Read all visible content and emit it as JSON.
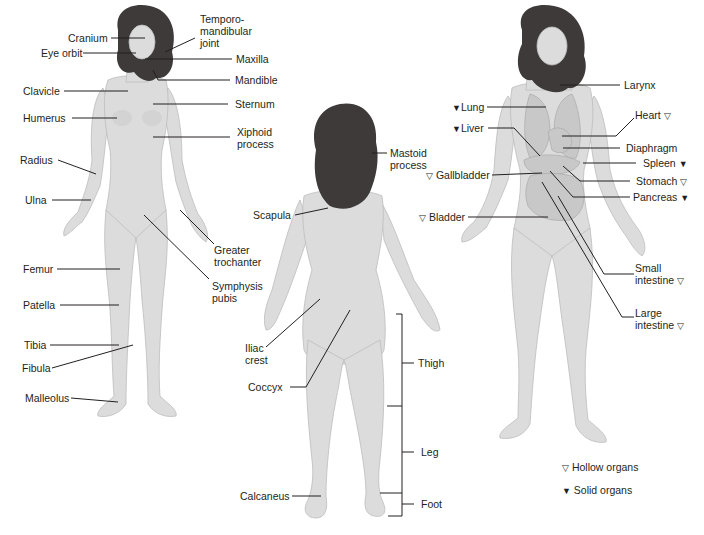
{
  "figures": {
    "anterior_skeletal": {
      "labels": [
        {
          "id": "cranium",
          "text": "Cranium"
        },
        {
          "id": "eye_orbit",
          "text": "Eye orbit"
        },
        {
          "id": "temporomandibular_joint",
          "text": "Temporo-\nmandibular\njoint"
        },
        {
          "id": "maxilla",
          "text": "Maxilla"
        },
        {
          "id": "mandible",
          "text": "Mandible"
        },
        {
          "id": "clavicle",
          "text": "Clavicle"
        },
        {
          "id": "sternum",
          "text": "Sternum"
        },
        {
          "id": "humerus",
          "text": "Humerus"
        },
        {
          "id": "xiphoid_process",
          "text": "Xiphoid\nprocess"
        },
        {
          "id": "radius",
          "text": "Radius"
        },
        {
          "id": "ulna",
          "text": "Ulna"
        },
        {
          "id": "greater_trochanter",
          "text": "Greater\ntrochanter"
        },
        {
          "id": "femur",
          "text": "Femur"
        },
        {
          "id": "symphysis_pubis",
          "text": "Symphysis\npubis"
        },
        {
          "id": "patella",
          "text": "Patella"
        },
        {
          "id": "tibia",
          "text": "Tibia"
        },
        {
          "id": "fibula",
          "text": "Fibula"
        },
        {
          "id": "malleolus",
          "text": "Malleolus"
        }
      ]
    },
    "posterior": {
      "labels": [
        {
          "id": "mastoid_process",
          "text": "Mastoid\nprocess"
        },
        {
          "id": "scapula",
          "text": "Scapula"
        },
        {
          "id": "iliac_crest",
          "text": "Iliac\ncrest"
        },
        {
          "id": "coccyx",
          "text": "Coccyx"
        },
        {
          "id": "calcaneus",
          "text": "Calcaneus"
        }
      ],
      "regions": [
        {
          "id": "thigh",
          "text": "Thigh"
        },
        {
          "id": "leg",
          "text": "Leg"
        },
        {
          "id": "foot",
          "text": "Foot"
        }
      ]
    },
    "anterior_organs": {
      "labels": [
        {
          "id": "larynx",
          "text": "Larynx",
          "symbol": ""
        },
        {
          "id": "lung",
          "text": "Lung",
          "symbol": "▼"
        },
        {
          "id": "heart",
          "text": "Heart",
          "symbol": "▽"
        },
        {
          "id": "liver",
          "text": "Liver",
          "symbol": "▼"
        },
        {
          "id": "diaphragm",
          "text": "Diaphragm",
          "symbol": ""
        },
        {
          "id": "spleen",
          "text": "Spleen",
          "symbol": "▼"
        },
        {
          "id": "gallbladder",
          "text": "Gallbladder",
          "symbol": "▽"
        },
        {
          "id": "stomach",
          "text": "Stomach",
          "symbol": "▽"
        },
        {
          "id": "pancreas",
          "text": "Pancreas",
          "symbol": "▼"
        },
        {
          "id": "bladder",
          "text": "Bladder",
          "symbol": "▽"
        },
        {
          "id": "small_intestine",
          "text": "Small\nintestine",
          "symbol": "▽"
        },
        {
          "id": "large_intestine",
          "text": "Large\nintestine",
          "symbol": "▽"
        }
      ]
    }
  },
  "legend": {
    "items": [
      {
        "symbol": "▽",
        "text": "Hollow organs"
      },
      {
        "symbol": "▼",
        "text": "Solid organs"
      }
    ]
  },
  "colors": {
    "text": "#231f20",
    "skin": "#dcdcdc",
    "hair": "#3d3a39",
    "background": "#ffffff"
  }
}
